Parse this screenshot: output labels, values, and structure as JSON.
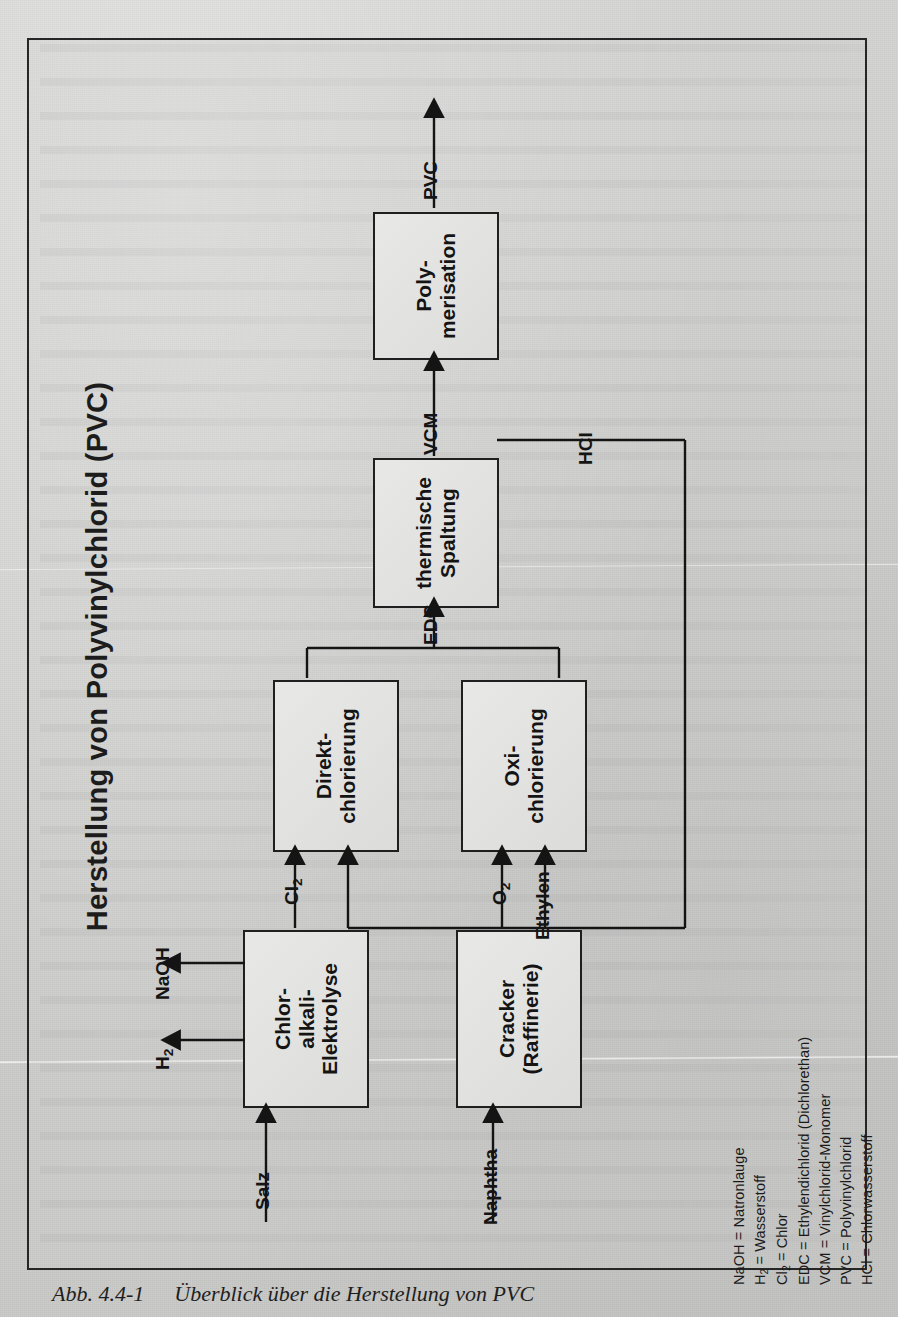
{
  "figure": {
    "title": "Herstellung von Polyvinylchlorid (PVC)",
    "caption_number": "Abb. 4.4-1",
    "caption_text": "Überblick über die Herstellung von PVC"
  },
  "colors": {
    "page_background": "#d0d0ce",
    "frame_border": "#262626",
    "box_fill": "#e4e4e2",
    "box_border": "#1f1f1f",
    "ink": "#141414"
  },
  "nodes": [
    {
      "id": "chlor-alkali-elektrolyse",
      "label": "Chlor-\nalkali-\nElektrolyse",
      "lines": [
        "Chlor-",
        "alkali-",
        "Elektrolyse"
      ]
    },
    {
      "id": "cracker-raffinerie",
      "label": "Cracker\n(Raffinerie)",
      "lines": [
        "Cracker",
        "(Raffinerie)"
      ]
    },
    {
      "id": "direktchlorierung",
      "label": "Direkt-\nchlorierung",
      "lines": [
        "Direkt-",
        "chlorierung"
      ]
    },
    {
      "id": "oxichlorierung",
      "label": "Oxi-\nchlorierung",
      "lines": [
        "Oxi-",
        "chlorierung"
      ]
    },
    {
      "id": "thermische-spaltung",
      "label": "thermische\nSpaltung",
      "lines": [
        "thermische",
        "Spaltung"
      ]
    },
    {
      "id": "polymerisation",
      "label": "Poly-\nmerisation",
      "lines": [
        "Poly-",
        "merisation"
      ]
    }
  ],
  "flows": {
    "salz": "Salz",
    "naphtha": "Naphtha",
    "naoh": "NaOH",
    "h2": "H",
    "h2_sub": "2",
    "cl2": "Cl",
    "cl2_sub": "2",
    "o2": "O",
    "o2_sub": "2",
    "ethylen": "Ethylen",
    "edc": "EDC",
    "vcm": "VCM",
    "hcl": "HCl",
    "pvc": "PVC"
  },
  "legend": [
    {
      "abbr": "NaOH",
      "sub": "",
      "expansion": " = Natronlauge"
    },
    {
      "abbr": "H",
      "sub": "2",
      "expansion": " = Wasserstoff"
    },
    {
      "abbr": "Cl",
      "sub": "2",
      "expansion": " = Chlor"
    },
    {
      "abbr": "EDC",
      "sub": "",
      "expansion": " = Ethylendichlorid (Dichlorethan)"
    },
    {
      "abbr": "VCM",
      "sub": "",
      "expansion": " = Vinylchlorid-Monomer"
    },
    {
      "abbr": "PVC",
      "sub": "",
      "expansion": " = Polyvinylchlorid"
    },
    {
      "abbr": "HCl",
      "sub": "",
      "expansion": " = Chlorwasserstoff"
    }
  ]
}
